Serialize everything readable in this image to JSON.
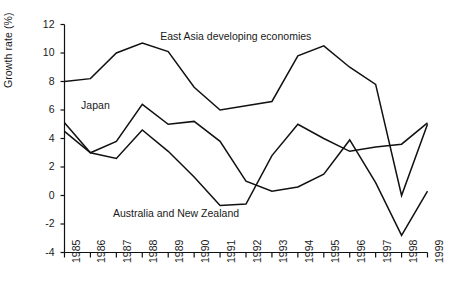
{
  "chart_data": {
    "type": "line",
    "title": "",
    "xlabel": "",
    "ylabel": "Growth rate (%)",
    "x": [
      1985,
      1986,
      1987,
      1988,
      1989,
      1990,
      1991,
      1992,
      1993,
      1994,
      1995,
      1996,
      1997,
      1998,
      1999
    ],
    "xticklabels": [
      "1985",
      "1986",
      "1987",
      "1988",
      "1989",
      "1990",
      "1991",
      "1992",
      "1993",
      "1994",
      "1995",
      "1996",
      "1997",
      "1998",
      "1999"
    ],
    "xlim": [
      1985,
      1999
    ],
    "ylim": [
      -4,
      12
    ],
    "yticks": [
      -4,
      -2,
      0,
      2,
      4,
      6,
      8,
      10,
      12
    ],
    "yticklabels": [
      "-4",
      "-2",
      "0",
      "2",
      "4",
      "6",
      "8",
      "10",
      "12"
    ],
    "grid": false,
    "legend": "inline-annotations",
    "line_color": "#111111",
    "series": [
      {
        "name": "East Asia developing economies",
        "values": [
          8.0,
          8.2,
          10.0,
          10.7,
          10.1,
          7.6,
          6.0,
          6.3,
          6.6,
          9.8,
          10.5,
          9.0,
          7.8,
          0.0,
          5.0
        ],
        "label_x": 1991.6,
        "label_y": 11.1
      },
      {
        "name": "Japan",
        "values": [
          5.1,
          3.0,
          3.8,
          6.4,
          5.0,
          5.2,
          3.8,
          1.0,
          0.3,
          0.6,
          1.5,
          3.9,
          0.9,
          -2.8,
          0.3
        ],
        "label_x": 1986.2,
        "label_y": 6.3
      },
      {
        "name": "Australia and New Zealand",
        "values": [
          4.5,
          3.0,
          2.6,
          4.6,
          3.1,
          1.3,
          -0.7,
          -0.6,
          2.8,
          5.0,
          4.0,
          3.1,
          3.4,
          3.6,
          5.1
        ],
        "label_x": 1989.3,
        "label_y": -1.3
      }
    ],
    "annotations": [
      {
        "text": "East Asia developing economies"
      },
      {
        "text": "Japan"
      },
      {
        "text": "Australia and New Zealand"
      }
    ]
  },
  "axes": {
    "y_axis_label": "Growth rate (%)"
  }
}
